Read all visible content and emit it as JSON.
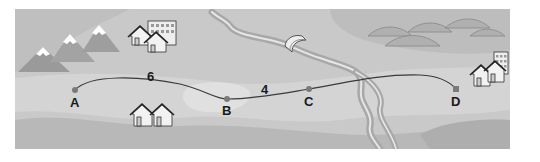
{
  "map": {
    "points": [
      {
        "id": "A",
        "label": "A",
        "x": 75,
        "y": 90
      },
      {
        "id": "B",
        "label": "B",
        "x": 227,
        "y": 99
      },
      {
        "id": "C",
        "label": "C",
        "x": 309,
        "y": 89
      },
      {
        "id": "D",
        "label": "D",
        "x": 456,
        "y": 89
      }
    ],
    "distances": [
      {
        "segment": "A-B",
        "label": "6"
      },
      {
        "segment": "B-C",
        "label": "4"
      }
    ],
    "features": [
      "mountains",
      "town-top-left",
      "houses-bottom-left",
      "river",
      "bridge",
      "hills",
      "town-right"
    ],
    "colors": {
      "background": "#c8c8c8",
      "light_band": "#d6d6d6",
      "dark_band": "#b4b4b4",
      "route": "#3a3a3a",
      "point": "#7a7a7a",
      "river": "#e4e4e4"
    }
  }
}
